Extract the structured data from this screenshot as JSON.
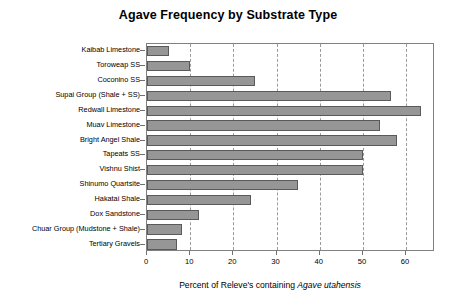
{
  "chart_data": {
    "type": "bar",
    "orientation": "horizontal",
    "title": "Agave Frequency by Substrate Type",
    "xlabel_prefix": "Percent of Releve's containing ",
    "xlabel_species": "Agave utahensis",
    "xlabel": "Percent of Releve's containing Agave utahensis",
    "ylabel": "",
    "xlim": [
      0,
      66.7
    ],
    "ylim": null,
    "grid": "vertical-dashed",
    "legend": null,
    "bar_color": "#969696",
    "bar_edge_color": "#5a5a5a",
    "axis_color": "#808080",
    "xticks": [
      "0",
      "10",
      "20",
      "30",
      "40",
      "50",
      "60"
    ],
    "xtick_values": [
      0,
      10,
      20,
      30,
      40,
      50,
      60
    ],
    "categories": [
      "Kaibab Limestone",
      "Toroweap SS",
      "Coconino SS",
      "Supai Group (Shale + SS)",
      "Redwall Limestone",
      "Muav Limestone",
      "Bright Angel Shale",
      "Tapeats SS",
      "Vishnu Shist",
      "Shinumo Quartsite",
      "Hakatai Shale",
      "Dox Sandstone",
      "Chuar Group (Mudstone + Shale)",
      "Tertiary Gravels"
    ],
    "values": [
      5,
      10,
      25,
      56.5,
      63.5,
      54,
      58,
      50,
      50,
      35,
      24,
      12,
      8,
      7
    ]
  }
}
